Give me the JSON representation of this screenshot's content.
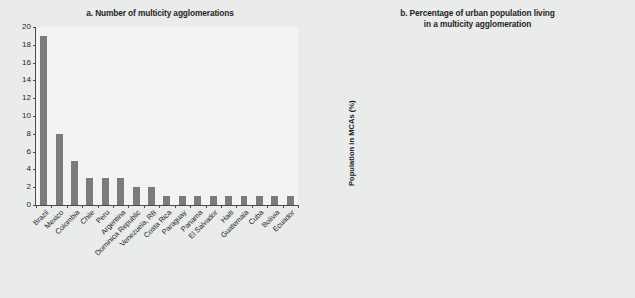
{
  "figure": {
    "background_color": "#eaebeb",
    "plot_background_color": "#f3f3f3",
    "bar_color": "#7b7b7b",
    "axis_color": "#4a4a4a",
    "text_color": "#241f1f"
  },
  "chart_data": [
    {
      "type": "bar",
      "title": "a. Number of multicity agglomerations",
      "xlabel": "",
      "ylabel": "",
      "ylim": [
        0,
        20
      ],
      "yticks": [
        0,
        2,
        4,
        6,
        8,
        10,
        12,
        14,
        16,
        18,
        20
      ],
      "grid": false,
      "legend": "none",
      "categories": [
        "Brazil",
        "Mexico",
        "Colombia",
        "Chile",
        "Peru",
        "Argentina",
        "Dominica Republic",
        "Venezuela, RB",
        "Costa Rica",
        "Paraguay",
        "Panama",
        "El Salvador",
        "Haiti",
        "Guatemala",
        "Cuba",
        "Bolivia",
        "Ecuador"
      ],
      "values": [
        19,
        8,
        5,
        3,
        3,
        3,
        2,
        2,
        1,
        1,
        1,
        1,
        1,
        1,
        1,
        1,
        1
      ]
    },
    {
      "type": "bar",
      "title": "b. Percentage of urban population living in a multicity agglomeration",
      "title_line1": "b. Percentage of urban population living",
      "title_line2": "in a multicity agglomeration",
      "xlabel": "",
      "ylabel": "Population in MCAs (%)",
      "ylim": [
        0,
        80
      ],
      "yticks": [
        0,
        10,
        20,
        30,
        40,
        50,
        60,
        70,
        80
      ],
      "grid": false,
      "legend": "none",
      "categories": [
        "Costa Rica",
        "Dominican Republic",
        "Paraguay",
        "Chile",
        "Peru",
        "Argentina",
        "Panama",
        "Colombia",
        "El Salvador",
        "Haiti",
        "Brazil",
        "Mexico",
        "Guatemala",
        "Cuba",
        "Bolivia",
        "Ecuador",
        "Venezuela, RB"
      ],
      "values": [
        72,
        64,
        58.5,
        55,
        55,
        49,
        48.5,
        46,
        43.5,
        43,
        41.5,
        39.5,
        34,
        31,
        28.5,
        26,
        16
      ]
    }
  ]
}
